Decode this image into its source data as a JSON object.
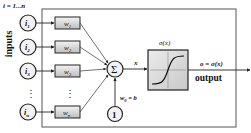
{
  "diagram": {
    "index_label": "i = 1...n",
    "inputs_label": "inputs",
    "inputs": [
      {
        "label": "i",
        "sub": "1",
        "weight": "w",
        "weight_sub": "1"
      },
      {
        "label": "i",
        "sub": "2",
        "weight": "w",
        "weight_sub": "2"
      },
      {
        "label": "i",
        "sub": "3",
        "weight": "w",
        "weight_sub": "3"
      },
      {
        "label": "i",
        "sub": "n",
        "weight": "w",
        "weight_sub": "n"
      }
    ],
    "ellipsis": "⋮",
    "summation_symbol": "Σ",
    "bias_node": "1",
    "bias_label": "w",
    "bias_sub": "0",
    "bias_eq": " = b",
    "sum_output_label": "x",
    "activation_label": "σ(x)",
    "output_eq": "o = σ(x)",
    "output_label": "output",
    "colors": {
      "stroke": "#222222",
      "node_fill": "#f2f2f2",
      "weight_fill_top": "#f4f4f4",
      "weight_fill_bottom": "#bdbdbd",
      "activation_fill": "#d9d9d9",
      "frame": "#555555"
    }
  }
}
